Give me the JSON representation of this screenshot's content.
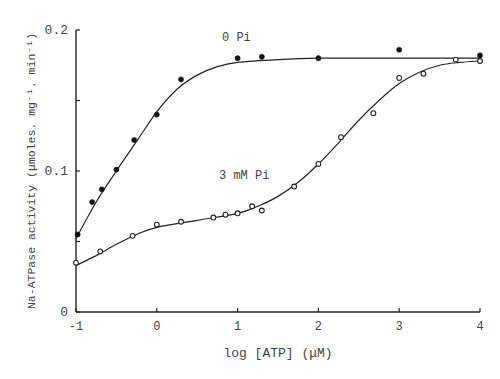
{
  "chart_data": {
    "type": "scatter",
    "title": "",
    "xlabel": "log [ATP] (μM)",
    "ylabel": "Na-ATPase activity (μmoles. mg⁻¹. min⁻¹)",
    "xlim": [
      -1,
      4
    ],
    "ylim": [
      0,
      0.2
    ],
    "x_ticks": [
      "-1",
      "0",
      "1",
      "2",
      "3",
      "4"
    ],
    "y_ticks": [
      "0",
      "0.1",
      "0.2"
    ],
    "grid": false,
    "legend": "none (inline curve labels)",
    "annotations": [
      "0 Pi",
      "3 mM Pi"
    ],
    "series": [
      {
        "name": "0 Pi",
        "marker": "filled-circle",
        "points": [
          {
            "x": -0.98,
            "y": 0.055
          },
          {
            "x": -0.8,
            "y": 0.078
          },
          {
            "x": -0.68,
            "y": 0.087
          },
          {
            "x": -0.5,
            "y": 0.101
          },
          {
            "x": -0.28,
            "y": 0.122
          },
          {
            "x": 0.0,
            "y": 0.14
          },
          {
            "x": 0.3,
            "y": 0.165
          },
          {
            "x": 1.0,
            "y": 0.18
          },
          {
            "x": 1.3,
            "y": 0.181
          },
          {
            "x": 2.0,
            "y": 0.18
          },
          {
            "x": 3.0,
            "y": 0.186
          },
          {
            "x": 4.0,
            "y": 0.182
          }
        ]
      },
      {
        "name": "3 mM Pi",
        "marker": "open-circle",
        "points": [
          {
            "x": -1.0,
            "y": 0.035
          },
          {
            "x": -0.7,
            "y": 0.043
          },
          {
            "x": -0.3,
            "y": 0.054
          },
          {
            "x": 0.0,
            "y": 0.062
          },
          {
            "x": 0.3,
            "y": 0.064
          },
          {
            "x": 0.7,
            "y": 0.067
          },
          {
            "x": 0.85,
            "y": 0.069
          },
          {
            "x": 1.0,
            "y": 0.07
          },
          {
            "x": 1.18,
            "y": 0.075
          },
          {
            "x": 1.3,
            "y": 0.072
          },
          {
            "x": 1.7,
            "y": 0.089
          },
          {
            "x": 2.0,
            "y": 0.105
          },
          {
            "x": 2.28,
            "y": 0.124
          },
          {
            "x": 2.68,
            "y": 0.141
          },
          {
            "x": 3.0,
            "y": 0.166
          },
          {
            "x": 3.3,
            "y": 0.169
          },
          {
            "x": 3.7,
            "y": 0.179
          },
          {
            "x": 4.0,
            "y": 0.178
          }
        ]
      }
    ],
    "curves": [
      {
        "name": "0 Pi fit",
        "points": [
          [
            -1,
            0.052
          ],
          [
            -0.75,
            0.078
          ],
          [
            -0.5,
            0.1
          ],
          [
            -0.25,
            0.121
          ],
          [
            0,
            0.142
          ],
          [
            0.25,
            0.158
          ],
          [
            0.5,
            0.168
          ],
          [
            0.75,
            0.174
          ],
          [
            1,
            0.177
          ],
          [
            1.5,
            0.179
          ],
          [
            2,
            0.18
          ],
          [
            3,
            0.18
          ],
          [
            4,
            0.18
          ]
        ]
      },
      {
        "name": "3 mM Pi fit",
        "points": [
          [
            -1,
            0.033
          ],
          [
            -0.75,
            0.04
          ],
          [
            -0.5,
            0.048
          ],
          [
            -0.25,
            0.055
          ],
          [
            0,
            0.06
          ],
          [
            0.5,
            0.065
          ],
          [
            1,
            0.07
          ],
          [
            1.25,
            0.075
          ],
          [
            1.5,
            0.082
          ],
          [
            1.75,
            0.092
          ],
          [
            2,
            0.105
          ],
          [
            2.25,
            0.12
          ],
          [
            2.5,
            0.136
          ],
          [
            2.75,
            0.15
          ],
          [
            3,
            0.162
          ],
          [
            3.25,
            0.17
          ],
          [
            3.5,
            0.175
          ],
          [
            3.75,
            0.177
          ],
          [
            4,
            0.178
          ]
        ]
      }
    ]
  },
  "plot": {
    "x_axis_label": "log [ATP] (μM)",
    "y_axis_label": "Na-ATPase activity (μmoles. mg⁻¹. min⁻¹)",
    "series_label_0": "0 Pi",
    "series_label_1": "3 mM Pi"
  }
}
